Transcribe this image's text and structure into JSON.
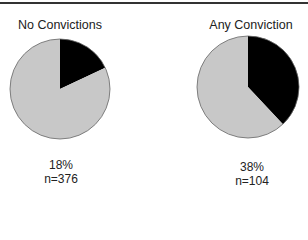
{
  "chart_data": {
    "type": "pie",
    "title": "",
    "charts": [
      {
        "title": "No Convictions",
        "slices": [
          {
            "name": "Yes",
            "value": 18,
            "color": "#000000"
          },
          {
            "name": "No",
            "value": 82,
            "color": "#c8c8c8"
          }
        ],
        "percent_label": "18%",
        "n_label": "n=376"
      },
      {
        "title": "Any Conviction",
        "slices": [
          {
            "name": "Yes",
            "value": 38,
            "color": "#000000"
          },
          {
            "name": "No",
            "value": 62,
            "color": "#c8c8c8"
          }
        ],
        "percent_label": "38%",
        "n_label": "n=104"
      }
    ]
  }
}
